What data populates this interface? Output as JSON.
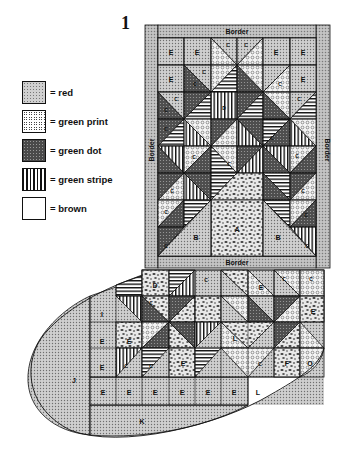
{
  "figure": {
    "number": "1"
  },
  "legend": [
    {
      "key": "red",
      "label": "= red",
      "pattern": "dots-fine"
    },
    {
      "key": "green_print",
      "label": "= green print",
      "pattern": "circles"
    },
    {
      "key": "green_dot",
      "label": "= green dot",
      "pattern": "dots-dark"
    },
    {
      "key": "green_stripe",
      "label": "= green stripe",
      "pattern": "stripes-vertical"
    },
    {
      "key": "brown",
      "label": "= brown",
      "pattern": "mottled"
    }
  ],
  "stocking": {
    "border_labels": {
      "top": "Border",
      "left": "Border",
      "right": "Border",
      "bottom": "Border"
    },
    "piece_labels": {
      "A": "A",
      "B": "B",
      "C": "C",
      "D": "D",
      "E": "E",
      "F": "F",
      "I": "I",
      "J": "J",
      "K": "K",
      "L": "L",
      "O": "O"
    }
  },
  "colors": {
    "ink": "#111111",
    "background": "#ffffff",
    "gray_fill": "#bdbdbd",
    "dark_fill": "#5a5a5a"
  }
}
